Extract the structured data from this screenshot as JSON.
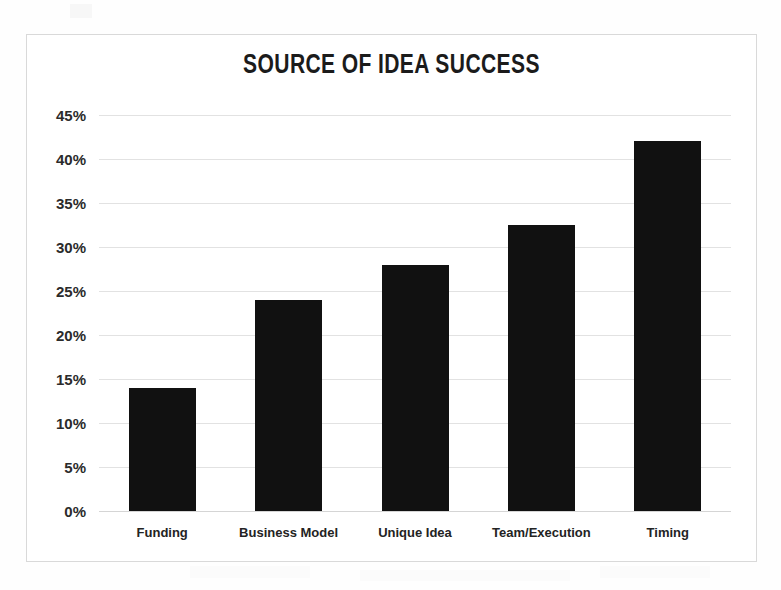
{
  "chart_data": {
    "type": "bar",
    "title": "SOURCE OF IDEA SUCCESS",
    "xlabel": "",
    "ylabel": "",
    "categories": [
      "Funding",
      "Business Model",
      "Unique Idea",
      "Team/Execution",
      "Timing"
    ],
    "values": [
      14,
      24,
      28,
      32.5,
      42
    ],
    "value_labels": [
      "14%",
      "24%",
      "28%",
      "32.5%",
      "42%"
    ],
    "ylim": [
      0,
      45
    ],
    "ytick_values": [
      45,
      40,
      35,
      30,
      25,
      20,
      15,
      10,
      5,
      0
    ],
    "ytick_labels": [
      "45%",
      "40%",
      "35%",
      "30%",
      "25%",
      "20%",
      "15%",
      "10%",
      "5%",
      "0%"
    ],
    "grid": true,
    "legend": false,
    "bar_color": "#111111",
    "grid_color": "#e2e2e2",
    "background_color": "#ffffff",
    "title_color": "#1b1b1b"
  }
}
